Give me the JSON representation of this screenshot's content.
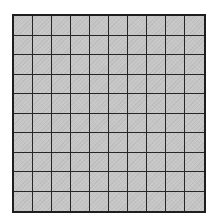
{
  "diagram": {
    "type": "square-grid",
    "rows": 10,
    "columns": 10,
    "cell_fill_color": "#c6c6c6",
    "line_color": "#1e1e1e",
    "background_color": "#ffffff"
  }
}
